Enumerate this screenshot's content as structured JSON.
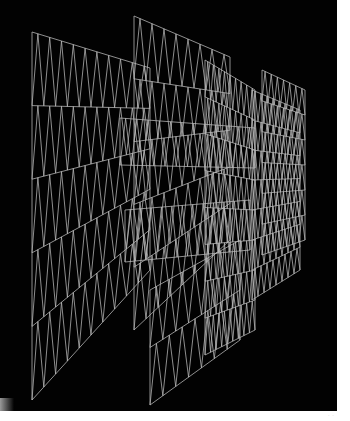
{
  "image": {
    "description": "Wireframe 3D mesh panels receding in perspective, curving to the right",
    "background_color": "#020202",
    "margin_color": "#ffffff",
    "line_color": "#b9b9b9",
    "frame": {
      "width": 337,
      "height": 411
    }
  },
  "panels": [
    {
      "name": "left-front-panel",
      "tl": [
        32,
        32
      ],
      "tr": [
        150,
        68
      ],
      "br": [
        150,
        270
      ],
      "bl": [
        32,
        400
      ],
      "cols": 10,
      "rows": 5
    },
    {
      "name": "center-upper-panel",
      "tl": [
        134,
        16
      ],
      "tr": [
        230,
        57
      ],
      "br": [
        230,
        240
      ],
      "bl": [
        134,
        330
      ],
      "cols": 8,
      "rows": 5
    },
    {
      "name": "center-lower-panel",
      "tl": [
        150,
        290
      ],
      "tr": [
        240,
        240
      ],
      "br": [
        240,
        340
      ],
      "bl": [
        150,
        405
      ],
      "cols": 7,
      "rows": 2
    },
    {
      "name": "right-curved-panel-1",
      "tl": [
        205,
        60
      ],
      "tr": [
        255,
        90
      ],
      "br": [
        255,
        330
      ],
      "bl": [
        205,
        355
      ],
      "cols": 9,
      "rows": 8
    },
    {
      "name": "right-curved-panel-2",
      "tl": [
        252,
        90
      ],
      "tr": [
        300,
        110
      ],
      "br": [
        300,
        270
      ],
      "bl": [
        252,
        300
      ],
      "cols": 8,
      "rows": 7
    },
    {
      "name": "right-far-panel",
      "tl": [
        262,
        70
      ],
      "tr": [
        305,
        90
      ],
      "br": [
        305,
        240
      ],
      "bl": [
        262,
        255
      ],
      "cols": 7,
      "rows": 6
    },
    {
      "name": "overlay-strip-1",
      "tl": [
        120,
        118
      ],
      "tr": [
        255,
        128
      ],
      "br": [
        255,
        168
      ],
      "bl": [
        120,
        165
      ],
      "cols": 12,
      "rows": 1
    },
    {
      "name": "overlay-strip-2",
      "tl": [
        125,
        210
      ],
      "tr": [
        250,
        200
      ],
      "br": [
        250,
        250
      ],
      "bl": [
        125,
        262
      ],
      "cols": 12,
      "rows": 1
    }
  ],
  "corner_mark": "· ·"
}
